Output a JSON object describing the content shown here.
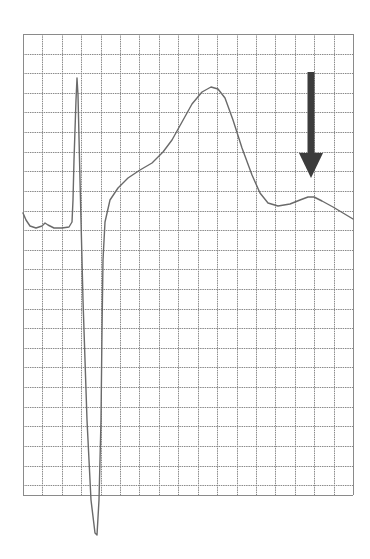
{
  "figure": {
    "type": "ecg-strip",
    "colors": {
      "background": "#ffffff",
      "grid": "#8a8a8a",
      "trace": "#6a6a6a",
      "arrow": "#3c3c3c"
    },
    "grid": {
      "left": 23,
      "top": 34,
      "right": 353,
      "bottom": 495,
      "columns": 17,
      "rows": 23.5
    },
    "trace_points": [
      [
        23,
        213
      ],
      [
        26,
        220
      ],
      [
        30,
        226
      ],
      [
        36,
        228
      ],
      [
        42,
        226
      ],
      [
        45,
        223
      ],
      [
        48,
        225
      ],
      [
        54,
        228
      ],
      [
        62,
        228
      ],
      [
        69,
        227
      ],
      [
        72,
        222
      ],
      [
        73,
        200
      ],
      [
        74,
        160
      ],
      [
        76,
        100
      ],
      [
        77,
        78
      ],
      [
        78,
        95
      ],
      [
        80,
        180
      ],
      [
        83,
        300
      ],
      [
        87,
        420
      ],
      [
        91,
        500
      ],
      [
        95,
        533
      ],
      [
        97,
        535
      ],
      [
        99,
        500
      ],
      [
        101,
        420
      ],
      [
        102,
        330
      ],
      [
        103,
        260
      ],
      [
        105,
        222
      ],
      [
        110,
        200
      ],
      [
        118,
        188
      ],
      [
        128,
        178
      ],
      [
        140,
        170
      ],
      [
        152,
        163
      ],
      [
        163,
        152
      ],
      [
        172,
        140
      ],
      [
        182,
        122
      ],
      [
        192,
        104
      ],
      [
        202,
        92
      ],
      [
        211,
        87
      ],
      [
        218,
        89
      ],
      [
        225,
        98
      ],
      [
        233,
        120
      ],
      [
        242,
        148
      ],
      [
        252,
        175
      ],
      [
        260,
        193
      ],
      [
        268,
        203
      ],
      [
        278,
        206
      ],
      [
        290,
        204
      ],
      [
        300,
        200
      ],
      [
        308,
        197
      ],
      [
        314,
        197
      ],
      [
        322,
        201
      ],
      [
        333,
        207
      ],
      [
        343,
        213
      ],
      [
        353,
        219
      ]
    ],
    "arrow": {
      "direction": "down",
      "x": 311,
      "shaft_top": 72,
      "shaft_bottom": 155,
      "head_bottom": 178,
      "head_half_width": 12,
      "shaft_width": 7
    }
  }
}
